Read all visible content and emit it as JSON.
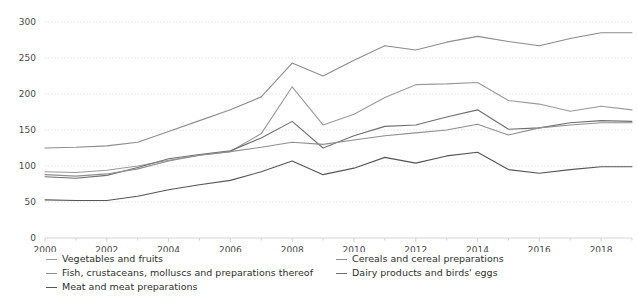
{
  "chart_data": {
    "type": "line",
    "title": "",
    "subtitle": "",
    "xlabel": "",
    "ylabel": "",
    "grid": true,
    "legend_position": "bottom",
    "xlim": [
      2000,
      2019
    ],
    "ylim": [
      0,
      300
    ],
    "y_ticks": [
      0,
      50,
      100,
      150,
      200,
      250,
      300
    ],
    "x_ticks": [
      2000,
      2002,
      2004,
      2006,
      2008,
      2010,
      2012,
      2014,
      2016,
      2018
    ],
    "x_minor_ticks": [
      2001,
      2003,
      2005,
      2007,
      2009,
      2011,
      2013,
      2015,
      2017,
      2019
    ],
    "x": [
      2000,
      2001,
      2002,
      2003,
      2004,
      2005,
      2006,
      2007,
      2008,
      2009,
      2010,
      2011,
      2012,
      2013,
      2014,
      2015,
      2016,
      2017,
      2018,
      2019
    ],
    "series": [
      {
        "name": "Cereals and cereal preparations",
        "color": "#8c8c8c",
        "values": [
          125,
          126,
          128,
          133,
          148,
          163,
          178,
          196,
          243,
          225,
          247,
          267,
          261,
          272,
          280,
          273,
          267,
          277,
          285,
          285
        ]
      },
      {
        "name": "Vegetables and fruits",
        "color": "#9a9a9a",
        "values": [
          92,
          91,
          94,
          100,
          108,
          115,
          120,
          145,
          210,
          157,
          172,
          195,
          213,
          214,
          216,
          191,
          186,
          176,
          183,
          178
        ]
      },
      {
        "name": "Dairy products and birds' eggs",
        "color": "#6f6f6f",
        "values": [
          85,
          83,
          87,
          98,
          110,
          116,
          121,
          139,
          162,
          125,
          142,
          155,
          157,
          168,
          178,
          151,
          153,
          160,
          163,
          162
        ]
      },
      {
        "name": "Fish, crustaceans, molluscs and preparations thereof",
        "color": "#8f8f8f",
        "values": [
          88,
          86,
          89,
          96,
          107,
          115,
          120,
          126,
          133,
          130,
          136,
          142,
          146,
          150,
          158,
          143,
          153,
          157,
          160,
          160
        ]
      },
      {
        "name": "Meat and meat preparations",
        "color": "#555555",
        "values": [
          53,
          52,
          52,
          58,
          67,
          74,
          80,
          92,
          107,
          88,
          97,
          112,
          104,
          114,
          119,
          95,
          90,
          95,
          99,
          99
        ]
      }
    ],
    "legend_order": [
      "Vegetables and fruits",
      "Cereals and cereal preparations",
      "Fish, crustaceans, molluscs and preparations thereof",
      "Dairy products and birds' eggs",
      "Meat and meat preparations"
    ]
  },
  "legend": {
    "column_a": [
      {
        "label": "Vegetables and fruits",
        "color": "#9a9a9a"
      },
      {
        "label": "Fish, crustaceans, molluscs and preparations thereof",
        "color": "#8f8f8f"
      },
      {
        "label": "Meat and meat preparations",
        "color": "#555555"
      }
    ],
    "column_b": [
      {
        "label": "Cereals and cereal preparations",
        "color": "#8c8c8c"
      },
      {
        "label": "Dairy products and birds' eggs",
        "color": "#6f6f6f"
      }
    ]
  },
  "axes": {
    "y_tick_labels": [
      "0",
      "50",
      "100",
      "150",
      "200",
      "250",
      "300"
    ],
    "x_tick_labels": [
      "2000",
      "2002",
      "2004",
      "2006",
      "2008",
      "2010",
      "2012",
      "2014",
      "2016",
      "2018"
    ]
  }
}
